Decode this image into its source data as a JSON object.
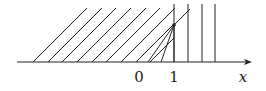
{
  "diagram": {
    "title": "",
    "axis": {
      "label": "x",
      "ticks": [
        {
          "label": "0",
          "x": 139
        },
        {
          "label": "1",
          "x": 174
        }
      ],
      "y": 62,
      "x_start": 17,
      "x_end": 252
    },
    "diagonal_lines": {
      "description": "parallel characteristic lines, slope 1, emanating from the x-axis to the left of x=1",
      "bases": [
        33,
        48,
        62,
        77,
        92,
        106,
        121
      ],
      "top_y": 8,
      "extra": [
        {
          "from": [
            121,
            62
          ],
          "to": [
            175,
            8
          ]
        },
        {
          "from": [
            136,
            62
          ],
          "to": [
            188,
            10
          ]
        }
      ]
    },
    "fan": {
      "description": "rarefaction fan from point on x=1",
      "apex": [
        174,
        25
      ],
      "bases": [
        148,
        161,
        174
      ]
    },
    "vertical_lines": {
      "description": "vertical characteristic lines for x >= 1",
      "x": [
        174,
        188,
        202,
        215
      ],
      "top_y": 4
    },
    "colors": {
      "line": "#222222",
      "background": "#ffffff"
    }
  }
}
